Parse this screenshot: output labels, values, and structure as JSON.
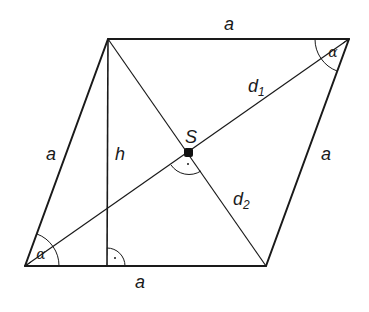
{
  "diagram": {
    "shape": "rhombus",
    "vertices": {
      "bottom_left": [
        25,
        266
      ],
      "bottom_right": [
        266,
        266
      ],
      "top_right": [
        349,
        39
      ],
      "top_left": [
        108,
        39
      ]
    },
    "height_foot": [
      107,
      266
    ],
    "center_point": [
      189,
      153
    ],
    "labels": {
      "side_top": "a",
      "side_left": "a",
      "side_right": "a",
      "side_bottom": "a",
      "height": "h",
      "center": "S",
      "diagonal_1": "d",
      "diagonal_1_sub": "1",
      "diagonal_2": "d",
      "diagonal_2_sub": "2",
      "angle_bottom_left": "α",
      "angle_top_right": "α",
      "right_angle_mark": "·"
    },
    "colors": {
      "stroke": "#1a1a1a",
      "background": "#ffffff"
    }
  }
}
